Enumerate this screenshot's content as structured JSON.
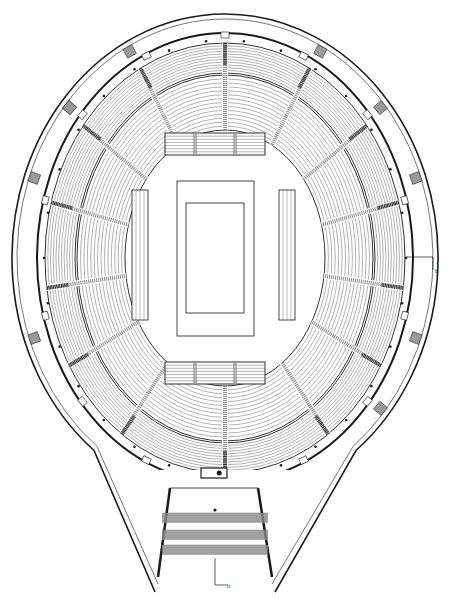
{
  "drawing": {
    "type": "architectural floor plan",
    "subject": "arena / stadium seating plan",
    "background": "#ffffff",
    "ink": "#1a1a1a",
    "seat_row_color": "#555555",
    "aisle_fill": "#8a8a8a",
    "stair_fill": "#9a9a9a",
    "width": 451,
    "height": 598
  },
  "center": {
    "cx": 225,
    "cy": 258
  },
  "outer_shell": {
    "rx": 213,
    "ry": 244,
    "top_y": 14,
    "tail_tip_left": [
      155,
      592
    ],
    "tail_tip_right": [
      275,
      592
    ]
  },
  "concourse": {
    "rx": 188,
    "ry": 225
  },
  "upper_tier": {
    "outer_rx": 180,
    "outer_ry": 215,
    "inner_rx": 150,
    "inner_ry": 185,
    "rows": 11
  },
  "lower_tier": {
    "outer_rx": 148,
    "outer_ry": 183,
    "inner_rx": 100,
    "inner_ry": 128,
    "rows": 14
  },
  "aisle_angles_deg": [
    -90,
    -62,
    -38,
    -15,
    8,
    30,
    55,
    90,
    125,
    150,
    172,
    195,
    218,
    242
  ],
  "vomitory_angles_deg": [
    -115,
    -90,
    -65,
    -40,
    -15,
    15,
    40,
    65,
    140,
    115,
    165,
    195,
    220
  ],
  "court": {
    "outer": {
      "x": 177,
      "y": 181,
      "w": 77,
      "h": 155
    },
    "inner": {
      "x": 186,
      "y": 203,
      "w": 58,
      "h": 110
    }
  },
  "end_stands": [
    {
      "name": "north-end-stand",
      "x": 165,
      "y": 133,
      "w": 100,
      "h": 22,
      "rows": 7
    },
    {
      "name": "south-end-stand",
      "x": 165,
      "y": 362,
      "w": 100,
      "h": 22,
      "rows": 7
    }
  ],
  "side_benches": [
    {
      "name": "west-side-bench",
      "x": 132,
      "y": 190,
      "w": 16,
      "h": 130
    },
    {
      "name": "east-side-bench",
      "x": 279,
      "y": 190,
      "w": 16,
      "h": 130
    }
  ],
  "entrance": {
    "control_box": {
      "x": 201,
      "y": 468,
      "w": 26,
      "h": 10
    },
    "dot": [
      215,
      510
    ],
    "stairs": [
      {
        "y": 513,
        "h": 10
      },
      {
        "y": 530,
        "h": 10
      },
      {
        "y": 545,
        "h": 10
      }
    ]
  },
  "section_markers": [
    {
      "name": "section-marker-east",
      "label": "b",
      "line": [
        [
          406,
          257
        ],
        [
          433,
          257
        ],
        [
          433,
          270
        ]
      ],
      "text_pos": [
        435,
        273
      ]
    },
    {
      "name": "section-marker-south",
      "label": "b",
      "line": [
        [
          215,
          558
        ],
        [
          215,
          585
        ],
        [
          227,
          585
        ]
      ],
      "text_pos": [
        227,
        588
      ]
    }
  ]
}
